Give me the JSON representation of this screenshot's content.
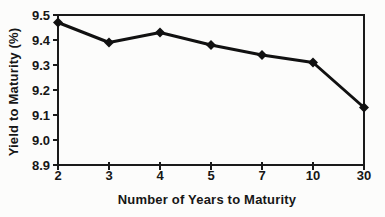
{
  "chart_data": {
    "type": "line",
    "title": "",
    "xlabel": "Number of Years to Maturity",
    "ylabel": "Yield to Maturity (%)",
    "categories": [
      "2",
      "3",
      "4",
      "5",
      "7",
      "10",
      "30"
    ],
    "values": [
      9.47,
      9.39,
      9.43,
      9.38,
      9.34,
      9.31,
      9.13
    ],
    "ylim": [
      8.9,
      9.5
    ],
    "yticks": [
      8.9,
      9.0,
      9.1,
      9.2,
      9.3,
      9.4,
      9.5
    ],
    "ytick_decimals": 1,
    "grid": false,
    "legend": false,
    "marker": "diamond",
    "line_color": "#111111",
    "marker_color": "#111111",
    "axis_color": "#1a1a1a",
    "background_color": "#fcfcfb"
  }
}
